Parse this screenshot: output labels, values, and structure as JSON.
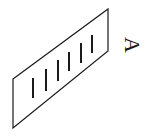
{
  "diagram": {
    "type": "grating-plane",
    "stroke_color": "#1a1a1a",
    "background_color": "#ffffff",
    "plane": {
      "points": [
        [
          13,
          79
        ],
        [
          108,
          9
        ],
        [
          108,
          51
        ],
        [
          13,
          128
        ]
      ]
    },
    "slits": [
      {
        "x": 33,
        "y1": 78,
        "y2": 98
      },
      {
        "x": 46,
        "y1": 69,
        "y2": 91
      },
      {
        "x": 58,
        "y1": 60,
        "y2": 81
      },
      {
        "x": 69,
        "y1": 52,
        "y2": 71
      },
      {
        "x": 81,
        "y1": 43,
        "y2": 63
      },
      {
        "x": 92,
        "y1": 35,
        "y2": 53
      }
    ],
    "label": {
      "text": "A",
      "rotation_deg": 90
    }
  }
}
